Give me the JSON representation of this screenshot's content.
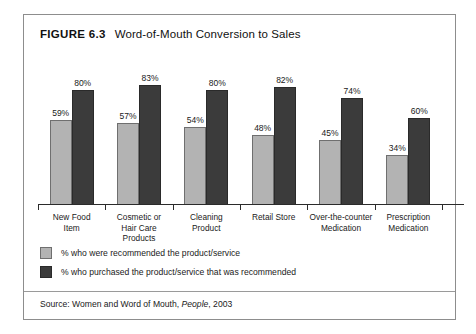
{
  "figure": {
    "label": "FIGURE 6.3",
    "caption": "Word-of-Mouth Conversion to Sales"
  },
  "source": {
    "prefix": "Source: Women and Word of Mouth,",
    "publication": "People",
    "suffix": ", 2003"
  },
  "colors": {
    "series_a": "#b3b3b3",
    "series_b": "#3b3b3b",
    "frame": "#8d8d8d",
    "axis": "#2b2b2b"
  },
  "chart_data": {
    "type": "bar",
    "title": "Word-of-Mouth Conversion to Sales",
    "xlabel": "",
    "ylabel": "",
    "ylim": [
      0,
      100
    ],
    "grid": false,
    "legend_position": "bottom-left",
    "categories": [
      "New Food Item",
      "Cosmetic or Hair Care Products",
      "Cleaning Product",
      "Retail Store",
      "Over-the-counter Medication",
      "Prescription Medication"
    ],
    "category_lines": [
      [
        "New Food",
        "Item"
      ],
      [
        "Cosmetic or",
        "Hair Care",
        "Products"
      ],
      [
        "Cleaning",
        "Product"
      ],
      [
        "Retail Store"
      ],
      [
        "Over-the-counter",
        "Medication"
      ],
      [
        "Prescription",
        "Medication"
      ]
    ],
    "series": [
      {
        "name": "% who were recommended the product/service",
        "color": "#b3b3b3",
        "values": [
          59,
          57,
          54,
          48,
          45,
          34
        ],
        "labels": [
          "59%",
          "57%",
          "54%",
          "48%",
          "45%",
          "34%"
        ]
      },
      {
        "name": "% who purchased the product/service that was recommended",
        "color": "#3b3b3b",
        "values": [
          80,
          83,
          80,
          82,
          74,
          60
        ],
        "labels": [
          "80%",
          "83%",
          "80%",
          "82%",
          "74%",
          "60%"
        ]
      }
    ]
  }
}
